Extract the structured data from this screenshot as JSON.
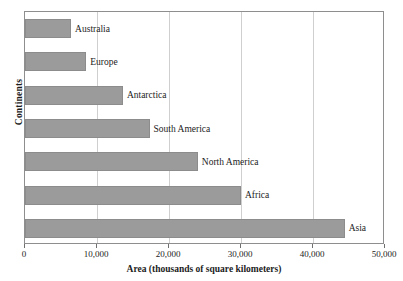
{
  "chart_data": {
    "type": "bar",
    "orientation": "horizontal",
    "title": "",
    "xlabel": "Area (thousands of square kilometers)",
    "ylabel": "Continents",
    "categories": [
      "Australia",
      "Europe",
      "Antarctica",
      "South America",
      "North America",
      "Africa",
      "Asia"
    ],
    "values": [
      6400,
      8500,
      13600,
      17300,
      24000,
      30000,
      44400
    ],
    "xlim": [
      0,
      50000
    ],
    "xticks": [
      0,
      10000,
      20000,
      30000,
      40000,
      50000
    ],
    "xticklabels": [
      "0",
      "10,000",
      "20,000",
      "30,000",
      "40,000",
      "50,000"
    ],
    "grid": "vertical",
    "legend": "none",
    "bar_color": "#9b9b9b",
    "bar_edge_color": "#8c8c8c",
    "gridline_color": "#cfcfcf",
    "frame_color": "#8e8e8e",
    "background_color": "#ffffff",
    "label_placement": "outside-end"
  }
}
